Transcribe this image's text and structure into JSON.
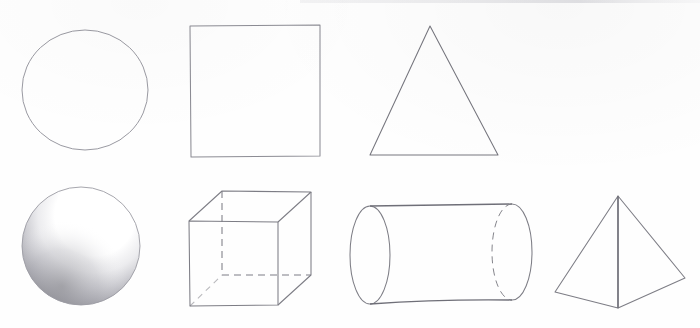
{
  "canvas": {
    "width": 700,
    "height": 328,
    "background": "#fefefe"
  },
  "drawing": {
    "title": "Geometric Shapes Pencil Study",
    "medium": "graphite pencil on white paper",
    "stroke_color": "#7a7a80",
    "stroke_color_dark": "#5f5f66",
    "shading_color": "#8e8e94",
    "rows": [
      {
        "name": "flat-shapes-row",
        "label": "2D outlines"
      },
      {
        "name": "solid-shapes-row",
        "label": "3D solids"
      }
    ],
    "shapes": [
      {
        "id": "circle",
        "name": "circle",
        "row": 0,
        "type": "2d-outline",
        "cx": 85,
        "cy": 90,
        "rx": 63,
        "ry": 60,
        "shaded": false
      },
      {
        "id": "square",
        "name": "square",
        "row": 0,
        "type": "2d-outline",
        "x": 190,
        "y": 25,
        "w": 130,
        "h": 132,
        "shaded": false
      },
      {
        "id": "triangle",
        "name": "triangle",
        "row": 0,
        "type": "2d-outline",
        "apex": [
          430,
          26
        ],
        "base_left": [
          370,
          155
        ],
        "base_right": [
          498,
          155
        ],
        "shaded": false
      },
      {
        "id": "sphere",
        "name": "sphere",
        "row": 1,
        "type": "3d-solid",
        "cx": 81,
        "cy": 246,
        "rx": 59,
        "ry": 59,
        "shaded": true,
        "light_direction": "upper-right",
        "shadow_region": "lower-left"
      },
      {
        "id": "cube",
        "name": "cube",
        "row": 1,
        "type": "3d-solid",
        "front_face": {
          "x": 189,
          "y": 221,
          "w": 89,
          "h": 84
        },
        "depth_offset": [
          33,
          -30
        ],
        "hidden_edges": "dashed",
        "shaded": false
      },
      {
        "id": "cylinder",
        "name": "cylinder",
        "row": 1,
        "type": "3d-solid",
        "orientation": "horizontal",
        "near_ellipse": {
          "cx": 370,
          "cy": 255,
          "rx": 20,
          "ry": 49
        },
        "far_ellipse": {
          "cx": 512,
          "cy": 252,
          "rx": 20,
          "ry": 48
        },
        "hidden_edges": "dashed",
        "shaded": false
      },
      {
        "id": "pyramid",
        "name": "pyramid",
        "row": 1,
        "type": "3d-solid",
        "apex": [
          618,
          196
        ],
        "base_left": [
          555,
          292
        ],
        "base_right": [
          685,
          278
        ],
        "base_front": [
          618,
          308
        ],
        "shaded": false
      }
    ]
  }
}
